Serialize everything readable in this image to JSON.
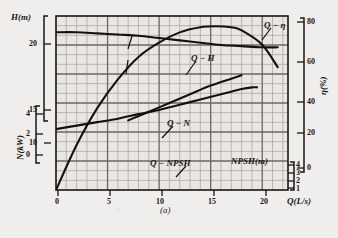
{
  "caption": "(a)",
  "axes": {
    "x": {
      "title": "Q(L/s)",
      "ticks": [
        "0",
        "5",
        "10",
        "15",
        "20"
      ]
    },
    "y_head": {
      "title": "H(m)",
      "ticks": [
        "20",
        "15",
        "10"
      ]
    },
    "y_power": {
      "title": "N(kW)",
      "ticks": [
        "4",
        "2",
        "0"
      ]
    },
    "y_eff": {
      "title": "η(%)",
      "ticks": [
        "80",
        "60",
        "40",
        "20",
        "0"
      ]
    },
    "y_npsh": {
      "title": "NPSH(m)",
      "ticks": [
        "4",
        "3",
        "2",
        "1"
      ]
    }
  },
  "curve_labels": {
    "eff": "Q − η",
    "head": "Q − H",
    "power": "Q − N",
    "npsh": "Q − NPSH"
  },
  "colors": {
    "ink": "#1a1714",
    "paper": "#efeeec",
    "grid_minor": "#a9a29a",
    "grid_major": "#6f6860"
  },
  "chart_data": {
    "type": "line",
    "title": "",
    "subtitle": "",
    "xlabel": "Q(L/s)",
    "ylabel": "H(m) / N(kW) / η(%) / NPSH(m)",
    "grid": true,
    "legend": "inline-annotations",
    "xlim": [
      0,
      22.5
    ],
    "axis_ranges": {
      "H_m": [
        8,
        23
      ],
      "N_kW": [
        0,
        5
      ],
      "eta_pct": [
        0,
        85
      ],
      "NPSH_m": [
        0,
        5
      ]
    },
    "series": [
      {
        "name": "Q − H",
        "axis": "H(m)",
        "units": "m",
        "x": [
          0,
          2,
          4,
          6,
          8,
          10,
          12,
          14,
          16,
          18,
          20,
          21.5
        ],
        "values": [
          21.6,
          21.6,
          21.5,
          21.4,
          21.3,
          21.1,
          20.9,
          20.7,
          20.5,
          20.4,
          20.3,
          20.3
        ]
      },
      {
        "name": "Q − η",
        "axis": "η(%)",
        "units": "%",
        "x": [
          0,
          2,
          4,
          6,
          8,
          10,
          12,
          14,
          15.5,
          17,
          18,
          20,
          21.5
        ],
        "values": [
          0,
          22,
          40,
          54,
          65,
          72,
          77,
          79.5,
          80,
          79.5,
          78,
          71,
          60
        ]
      },
      {
        "name": "Q − N",
        "axis": "N(kW)",
        "units": "kW",
        "x": [
          0,
          2,
          4,
          6,
          8,
          10,
          12,
          14,
          16,
          18,
          19,
          19.5
        ],
        "values": [
          1.75,
          1.85,
          1.95,
          2.05,
          2.18,
          2.3,
          2.45,
          2.6,
          2.75,
          2.9,
          2.95,
          2.95
        ]
      },
      {
        "name": "Q − NPSH",
        "axis": "NPSH(m)",
        "units": "m",
        "x": [
          7,
          9,
          11,
          13,
          15,
          17,
          18
        ],
        "values": [
          2.0,
          2.25,
          2.5,
          2.75,
          3.0,
          3.2,
          3.3
        ]
      }
    ]
  }
}
